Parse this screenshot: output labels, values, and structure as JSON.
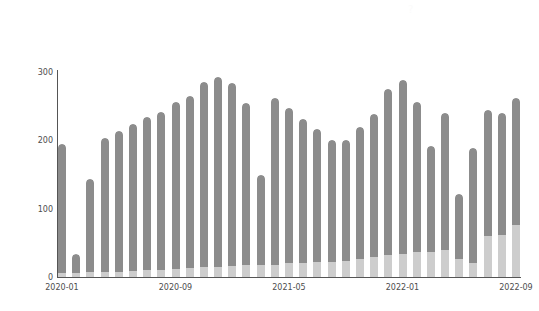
{
  "chart_data": {
    "type": "bar",
    "stacked": true,
    "title": "",
    "subtitle": "",
    "xlabel": "",
    "ylabel": "",
    "ylim": [
      0,
      300
    ],
    "yticks": [
      0,
      100,
      200,
      300
    ],
    "ytick_labels": [
      "0",
      "100",
      "200",
      "300"
    ],
    "grid": false,
    "legend": "none",
    "xtick_labels": [
      "2020-01",
      "2020-09",
      "2021-05",
      "2022-01",
      "2022-09"
    ],
    "xtick_categories": [
      "2020-01",
      "2020-09",
      "2021-05",
      "2022-01",
      "2022-09"
    ],
    "colors": {
      "series_upper": "#8c8c8c",
      "series_lower": "#cdcdcd",
      "axis": "#555555",
      "text": "#4d4d4d",
      "background": "#ffffff"
    },
    "categories": [
      "2020-01",
      "2020-02",
      "2020-03",
      "2020-04",
      "2020-05",
      "2020-06",
      "2020-07",
      "2020-08",
      "2020-09",
      "2020-10",
      "2020-11",
      "2020-12",
      "2021-01",
      "2021-02",
      "2021-03",
      "2021-04",
      "2021-05",
      "2021-06",
      "2021-07",
      "2021-08",
      "2021-09",
      "2021-10",
      "2021-11",
      "2021-12",
      "2022-01",
      "2022-02",
      "2022-03",
      "2022-04",
      "2022-05",
      "2022-06",
      "2022-07",
      "2022-08",
      "2022-09"
    ],
    "series": [
      {
        "name": "upper",
        "color": "#8c8c8c",
        "values": [
          188,
          28,
          137,
          196,
          205,
          215,
          224,
          232,
          245,
          252,
          272,
          278,
          268,
          237,
          133,
          244,
          228,
          210,
          194,
          178,
          176,
          194,
          208,
          243,
          255,
          220,
          155,
          200,
          95,
          168,
          185,
          178,
          186
        ]
      },
      {
        "name": "lower",
        "color": "#cdcdcd",
        "values": [
          6,
          6,
          7,
          8,
          8,
          9,
          10,
          10,
          11,
          13,
          14,
          15,
          16,
          17,
          17,
          18,
          20,
          21,
          22,
          22,
          24,
          26,
          30,
          32,
          34,
          36,
          37,
          40,
          27,
          21,
          60,
          62,
          76
        ]
      }
    ],
    "totals": [
      194,
      34,
      144,
      204,
      213,
      224,
      234,
      242,
      256,
      265,
      286,
      293,
      284,
      254,
      150,
      262,
      248,
      231,
      216,
      200,
      200,
      220,
      238,
      275,
      289,
      256,
      192,
      240,
      122,
      189,
      245,
      240,
      262
    ]
  },
  "annotations": {
    "watermark": "?"
  }
}
